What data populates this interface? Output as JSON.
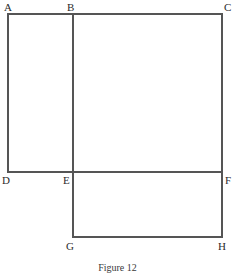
{
  "figure": {
    "caption": "Figure 12",
    "line_color": "#555555",
    "label_color": "#2b2b2b",
    "background_color": "#ffffff",
    "stroke_width": 1.2,
    "vertices": [
      {
        "id": "A",
        "label": "A",
        "x": 8,
        "y": 14,
        "label_x": 4,
        "label_y": 2
      },
      {
        "id": "B",
        "label": "B",
        "x": 73,
        "y": 14,
        "label_x": 67,
        "label_y": 2
      },
      {
        "id": "C",
        "label": "C",
        "x": 222,
        "y": 14,
        "label_x": 224,
        "label_y": 2
      },
      {
        "id": "D",
        "label": "D",
        "x": 8,
        "y": 172,
        "label_x": 2,
        "label_y": 175
      },
      {
        "id": "E",
        "label": "E",
        "x": 73,
        "y": 172,
        "label_x": 63,
        "label_y": 175
      },
      {
        "id": "F",
        "label": "F",
        "x": 222,
        "y": 172,
        "label_x": 225,
        "label_y": 175
      },
      {
        "id": "G",
        "label": "G",
        "x": 73,
        "y": 237,
        "label_x": 66,
        "label_y": 241
      },
      {
        "id": "H",
        "label": "H",
        "x": 222,
        "y": 237,
        "label_x": 218,
        "label_y": 241
      }
    ],
    "segments": [
      {
        "name": "segment-AC-top",
        "x1": 8,
        "y1": 14,
        "x2": 222,
        "y2": 14
      },
      {
        "name": "segment-AD-left",
        "x1": 8,
        "y1": 14,
        "x2": 8,
        "y2": 172
      },
      {
        "name": "segment-BG-middle",
        "x1": 73,
        "y1": 14,
        "x2": 73,
        "y2": 237
      },
      {
        "name": "segment-CH-right",
        "x1": 222,
        "y1": 14,
        "x2": 222,
        "y2": 237
      },
      {
        "name": "segment-DF-middle",
        "x1": 8,
        "y1": 172,
        "x2": 222,
        "y2": 172
      },
      {
        "name": "segment-GH-bottom",
        "x1": 73,
        "y1": 237,
        "x2": 222,
        "y2": 237
      }
    ]
  }
}
